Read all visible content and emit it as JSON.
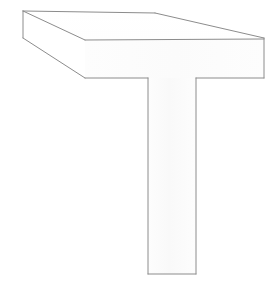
{
  "figure": {
    "name": "3d-t-shaped-block",
    "title": "",
    "canvas": {
      "width": 270,
      "height": 283
    },
    "style": {
      "background_color": "#ffffff",
      "stroke_color": "#8c8c8c",
      "top_face_fill": "#ffffff",
      "front_face_fill": "#fdfdfd",
      "left_face_fill": "#ffffff",
      "stem_face_fill": "#fcfcfc",
      "stroke_width": 1
    },
    "faces": [
      {
        "id": "slab-top-face",
        "label": "Top face of horizontal slab",
        "points": "23,11 155,13 264,38 85,40"
      },
      {
        "id": "slab-left-end-face",
        "label": "Left end face of horizontal slab",
        "points": "23,11 85,40 85,78 23,38"
      },
      {
        "id": "slab-front-face",
        "label": "Front face of horizontal slab",
        "points": "85,40 264,38 264,78 85,78"
      },
      {
        "id": "stem-front-face",
        "label": "Front face of vertical stem",
        "points": "148,78 196,78 196,274 148,274"
      }
    ],
    "edges": [
      {
        "id": "back-top-edge-horizontal",
        "label": "Back top edge (horizontal run)",
        "x1": 23,
        "y1": 11,
        "x2": 155,
        "y2": 13
      },
      {
        "id": "back-top-edge-slanted",
        "label": "Back top edge (receding run)",
        "x1": 155,
        "y1": 13,
        "x2": 264,
        "y2": 38
      },
      {
        "id": "top-front-edge",
        "label": "Top front edge of slab",
        "x1": 85,
        "y1": 40,
        "x2": 264,
        "y2": 39
      },
      {
        "id": "left-receding-top-edge",
        "label": "Left receding top edge",
        "x1": 23,
        "y1": 11,
        "x2": 85,
        "y2": 40
      },
      {
        "id": "left-vertical-edge",
        "label": "Left end vertical edge",
        "x1": 23,
        "y1": 11,
        "x2": 23,
        "y2": 38
      },
      {
        "id": "left-receding-bottom-edge",
        "label": "Left receding bottom edge",
        "x1": 23,
        "y1": 38,
        "x2": 85,
        "y2": 78
      },
      {
        "id": "front-bottom-edge-left",
        "label": "Slab bottom edge left of stem",
        "x1": 85,
        "y1": 78,
        "x2": 148,
        "y2": 78
      },
      {
        "id": "front-bottom-edge-right",
        "label": "Slab bottom edge right of stem",
        "x1": 196,
        "y1": 78,
        "x2": 264,
        "y2": 78
      },
      {
        "id": "right-vertical-edge",
        "label": "Right end vertical edge",
        "x1": 264,
        "y1": 38,
        "x2": 264,
        "y2": 78
      },
      {
        "id": "stem-left-edge",
        "label": "Stem left vertical edge",
        "x1": 148,
        "y1": 78,
        "x2": 148,
        "y2": 274
      },
      {
        "id": "stem-right-edge",
        "label": "Stem right vertical edge",
        "x1": 196,
        "y1": 78,
        "x2": 196,
        "y2": 274
      },
      {
        "id": "stem-bottom-edge",
        "label": "Stem bottom edge",
        "x1": 148,
        "y1": 274,
        "x2": 196,
        "y2": 274
      }
    ]
  }
}
